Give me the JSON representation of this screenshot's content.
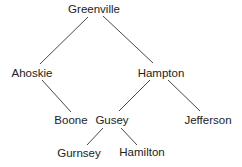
{
  "diagram": {
    "type": "tree",
    "colors": {
      "edge": "#333333",
      "text": "#222222",
      "background": "#ffffff"
    },
    "nodes": [
      {
        "id": "greenville",
        "label": "Greenville",
        "x": 94,
        "y": 3
      },
      {
        "id": "ahoskie",
        "label": "Ahoskie",
        "x": 32,
        "y": 67
      },
      {
        "id": "hampton",
        "label": "Hampton",
        "x": 161,
        "y": 67
      },
      {
        "id": "boone",
        "label": "Boone",
        "x": 71,
        "y": 114
      },
      {
        "id": "gusey",
        "label": "Gusey",
        "x": 112,
        "y": 114
      },
      {
        "id": "jefferson",
        "label": "Jefferson",
        "x": 208,
        "y": 114
      },
      {
        "id": "gurnsey",
        "label": "Gurnsey",
        "x": 79,
        "y": 147
      },
      {
        "id": "hamilton",
        "label": "Hamilton",
        "x": 142,
        "y": 146
      }
    ],
    "edges": [
      {
        "from": "Greenville",
        "to": "Ahoskie",
        "x1": 88,
        "y1": 17,
        "x2": 40,
        "y2": 64
      },
      {
        "from": "Greenville",
        "to": "Hampton",
        "x1": 103,
        "y1": 16,
        "x2": 153,
        "y2": 63
      },
      {
        "from": "Ahoskie",
        "to": "Boone",
        "x1": 42,
        "y1": 80,
        "x2": 71,
        "y2": 112
      },
      {
        "from": "Hampton",
        "to": "Gusey",
        "x1": 150,
        "y1": 80,
        "x2": 119,
        "y2": 111
      },
      {
        "from": "Hampton",
        "to": "Jefferson",
        "x1": 168,
        "y1": 80,
        "x2": 200,
        "y2": 111
      },
      {
        "from": "Gusey",
        "to": "Gurnsey",
        "x1": 103,
        "y1": 128,
        "x2": 87,
        "y2": 145
      },
      {
        "from": "Gusey",
        "to": "Hamilton",
        "x1": 121,
        "y1": 128,
        "x2": 137,
        "y2": 145
      }
    ]
  }
}
